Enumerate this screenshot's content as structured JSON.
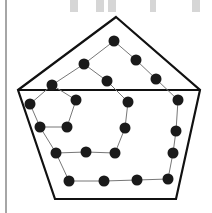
{
  "figure": {
    "background_text": "HHTN",
    "colors": {
      "outline": "#111111",
      "dot": "#1a1a1a",
      "path": "#777777",
      "faded_text": "#d0d0d0",
      "border": "#888888"
    }
  },
  "nodes": [
    {
      "id": "n1"
    },
    {
      "id": "n2"
    },
    {
      "id": "n3"
    },
    {
      "id": "n4"
    },
    {
      "id": "n5"
    },
    {
      "id": "n6"
    },
    {
      "id": "n7"
    },
    {
      "id": "n8"
    },
    {
      "id": "n9"
    },
    {
      "id": "n10"
    },
    {
      "id": "n11"
    },
    {
      "id": "n12"
    },
    {
      "id": "n13"
    },
    {
      "id": "n14"
    },
    {
      "id": "n15"
    },
    {
      "id": "n16"
    },
    {
      "id": "n17"
    },
    {
      "id": "n18"
    },
    {
      "id": "n19"
    },
    {
      "id": "n20"
    },
    {
      "id": "n21"
    },
    {
      "id": "n22"
    }
  ]
}
